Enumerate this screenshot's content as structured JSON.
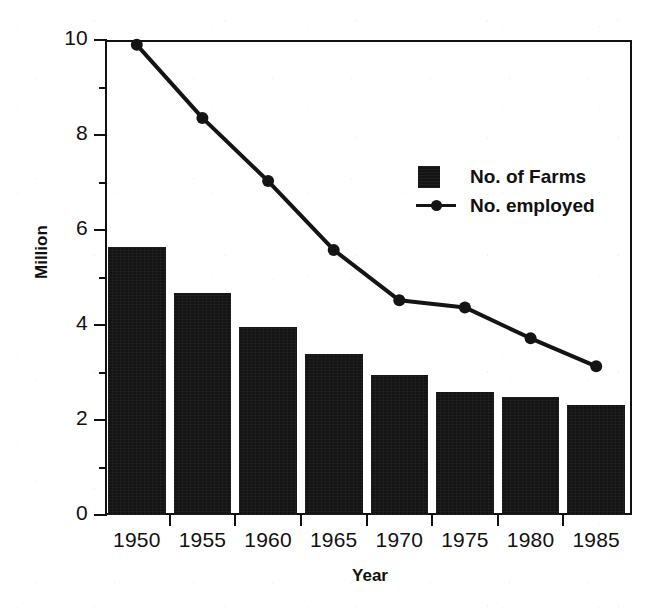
{
  "chart_data": {
    "type": "bar",
    "title": "",
    "subtitle": "",
    "xlabel": "Year",
    "ylabel": "Million",
    "categories": [
      "1950",
      "1955",
      "1960",
      "1965",
      "1970",
      "1975",
      "1980",
      "1985"
    ],
    "ylim": [
      0,
      10
    ],
    "xlim_note": "categorical, 8 five-year intervals",
    "y_major_ticks": [
      "0",
      "2",
      "4",
      "6",
      "8",
      "10"
    ],
    "y_minor_ticks": [
      1,
      3,
      5,
      7,
      9
    ],
    "grid": false,
    "legend_position": "inside upper-right",
    "series": [
      {
        "name": "No. of Farms",
        "kind": "bar",
        "color": "#141414",
        "values": [
          5.65,
          4.67,
          3.95,
          3.4,
          2.95,
          2.59,
          2.48,
          2.32
        ]
      },
      {
        "name": "No. employed",
        "kind": "line",
        "color": "#141414",
        "marker": "filled-circle",
        "values": [
          9.9,
          8.36,
          7.03,
          5.58,
          4.52,
          4.37,
          3.72,
          3.13
        ]
      }
    ],
    "annotations": []
  },
  "axes": {
    "y_title": "Million",
    "x_title": "Year",
    "y_tick_labels": [
      "10",
      "8",
      "6",
      "4",
      "2",
      "0"
    ],
    "x_tick_labels": [
      "1950",
      "1955",
      "1960",
      "1965",
      "1970",
      "1975",
      "1980",
      "1985"
    ]
  },
  "legend": {
    "items": [
      {
        "label": "No. of Farms",
        "key": "filled-square-swatch"
      },
      {
        "label": "No. employed",
        "key": "line-with-dot-marker"
      }
    ]
  },
  "colors": {
    "ink": "#111111",
    "series_fill": "#141414",
    "background": "#ffffff"
  }
}
